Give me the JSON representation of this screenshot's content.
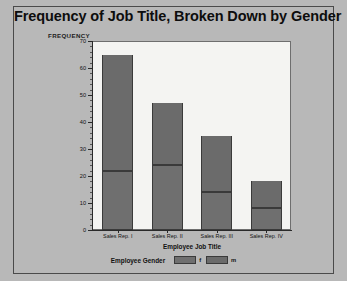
{
  "chart_data": {
    "type": "bar",
    "subtype": "stacked-bar",
    "title": "Frequency of Job Title, Broken Down by Gender",
    "xlabel": "Employee Job Title",
    "ylabel": "FREQUENCY",
    "categories": [
      "Sales Rep. I",
      "Sales Rep. II",
      "Sales Rep. III",
      "Sales Rep. IV"
    ],
    "series": [
      {
        "name": "f",
        "values": [
          22,
          24,
          14,
          8
        ],
        "color": "#6f6f6f"
      },
      {
        "name": "m",
        "values": [
          43,
          23,
          21,
          10
        ],
        "color": "#6b6b6b"
      }
    ],
    "totals": [
      65,
      47,
      35,
      18
    ],
    "ylim": [
      0,
      70
    ],
    "yticks": [
      0,
      10,
      20,
      30,
      40,
      50,
      60,
      70
    ],
    "ytick_labels": [
      "0",
      "10",
      "20",
      "30",
      "40",
      "50",
      "60",
      "70"
    ],
    "grid": false,
    "legend_position": "bottom",
    "legend_title": "Employee Gender",
    "legend_entries": [
      "f",
      "m"
    ],
    "plot_background": "#f4f4f2",
    "panel_background": "#b8b8b8"
  }
}
